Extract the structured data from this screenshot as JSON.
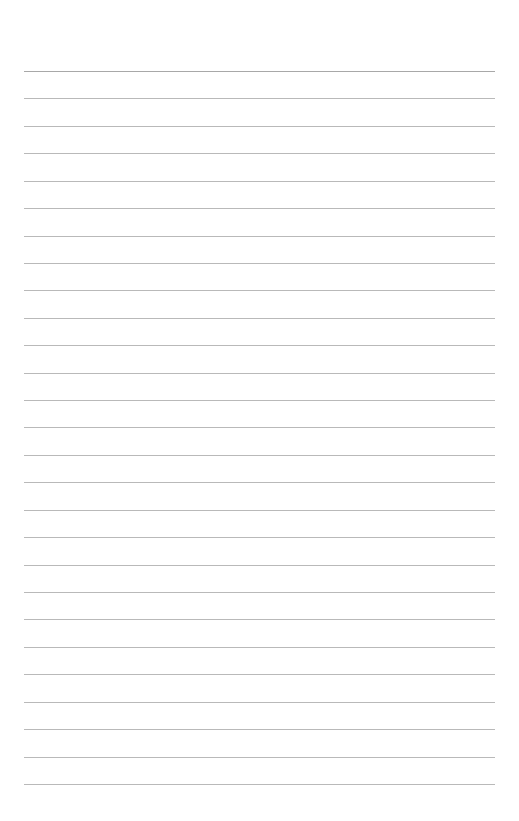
{
  "page": {
    "type": "blank-ruled-sheet",
    "background_color": "#ffffff",
    "line_color": "#b9b9b9",
    "line_count": 27,
    "first_line_y": 71,
    "line_spacing": 27.42,
    "line_left": 24,
    "line_right": 495,
    "text_lines": []
  }
}
